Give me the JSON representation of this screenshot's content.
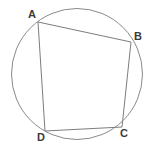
{
  "figure": {
    "background_color": "#ffffff",
    "stroke_color": "#8a8a8a",
    "label_color": "#3a3a3a",
    "canvas": {
      "width": 152,
      "height": 153
    },
    "circle": {
      "name": "circumscribed-circle",
      "cx": 77,
      "cy": 74,
      "r": 65.5,
      "stroke": "#8a8a8a",
      "stroke_width": 1,
      "fill": "none"
    },
    "quadrilateral": {
      "name": "quadrilateral-ABCD",
      "fill": "none",
      "stroke": "#7d7d7d",
      "stroke_width": 1,
      "points": "38,22 131,42 122,127 45,131"
    },
    "vertices": [
      {
        "id": "A",
        "label": "A",
        "x": 38,
        "y": 22,
        "label_x": 28,
        "label_y": 9
      },
      {
        "id": "B",
        "label": "B",
        "x": 131,
        "y": 42,
        "label_x": 134,
        "label_y": 31
      },
      {
        "id": "C",
        "label": "C",
        "x": 122,
        "y": 127,
        "label_x": 120,
        "label_y": 128
      },
      {
        "id": "D",
        "label": "D",
        "x": 45,
        "y": 131,
        "label_x": 37,
        "label_y": 132
      }
    ],
    "edges": [
      {
        "id": "AB",
        "from": "A",
        "to": "B"
      },
      {
        "id": "BC",
        "from": "B",
        "to": "C"
      },
      {
        "id": "CD",
        "from": "C",
        "to": "D"
      },
      {
        "id": "DA",
        "from": "D",
        "to": "A"
      }
    ]
  }
}
